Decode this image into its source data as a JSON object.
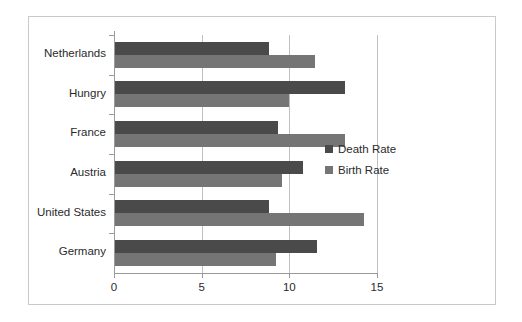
{
  "chart_data": {
    "type": "bar",
    "orientation": "horizontal",
    "title": "",
    "xlabel": "",
    "ylabel": "",
    "categories": [
      "Netherlands",
      "Hungry",
      "France",
      "Austria",
      "United States",
      "Germany"
    ],
    "series": [
      {
        "name": "Death Rate",
        "color": "#4a4a4a",
        "values": [
          8.8,
          13.1,
          9.3,
          10.7,
          8.8,
          11.5
        ]
      },
      {
        "name": "Birth Rate",
        "color": "#757575",
        "values": [
          11.4,
          9.9,
          13.1,
          9.5,
          14.2,
          9.2
        ]
      }
    ],
    "xlim": [
      0,
      15
    ],
    "xticks": [
      0,
      5,
      10,
      15
    ],
    "xtick_labels": [
      "0",
      "5",
      "10",
      "15"
    ],
    "grid": "vertical",
    "legend_position": "right",
    "legend": [
      "Death Rate",
      "Birth Rate"
    ]
  },
  "style": {
    "frame_border_color": "#c9c9c9",
    "axis_color": "#9a9a9a",
    "gridline_color": "#bfbfbf",
    "text_color": "#2b2b2b",
    "background": "#ffffff"
  }
}
